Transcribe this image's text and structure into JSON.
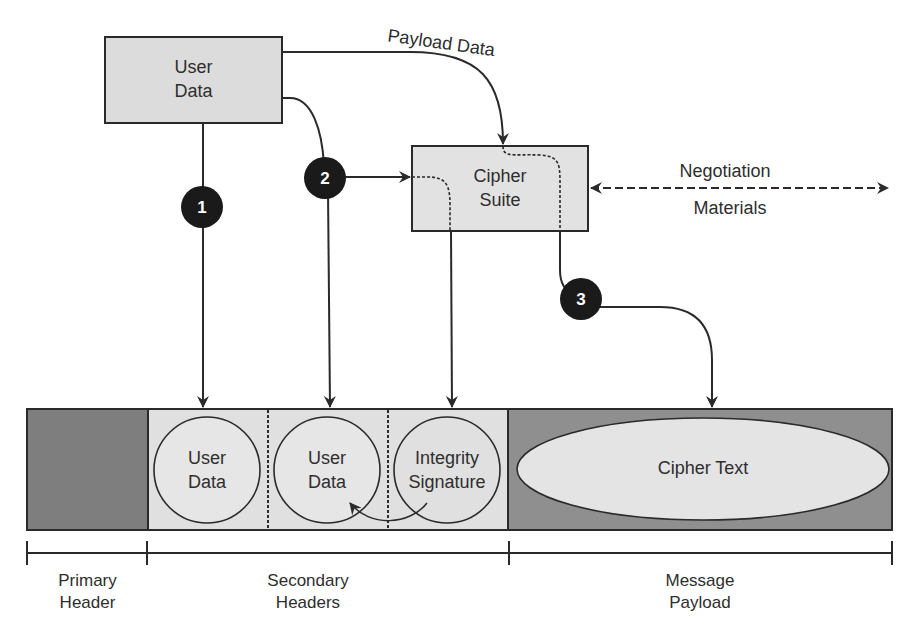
{
  "diagram": {
    "nodes": {
      "user_data_box": {
        "line1": "User",
        "line2": "Data"
      },
      "cipher_suite_box": {
        "line1": "Cipher",
        "line2": "Suite"
      }
    },
    "edges": {
      "payload_data_label": "Payload Data",
      "negotiation_label": "Negotiation",
      "materials_label": "Materials"
    },
    "steps": [
      {
        "number": "1"
      },
      {
        "number": "2"
      },
      {
        "number": "3"
      }
    ],
    "packet": {
      "secondary_fields": [
        {
          "line1": "User",
          "line2": "Data"
        },
        {
          "line1": "User",
          "line2": "Data"
        },
        {
          "line1": "Integrity",
          "line2": "Signature"
        }
      ],
      "payload_field": "Cipher Text"
    },
    "sections": [
      {
        "line1": "Primary",
        "line2": "Header"
      },
      {
        "line1": "Secondary",
        "line2": "Headers"
      },
      {
        "line1": "Message",
        "line2": "Payload"
      }
    ],
    "colors": {
      "box_fill": "#dcdcdc",
      "dark_fill": "#8a8a8a",
      "light_fill": "#e8e8e8",
      "stroke": "#2a2a2a",
      "badge_fill": "#1a1a1a"
    }
  }
}
